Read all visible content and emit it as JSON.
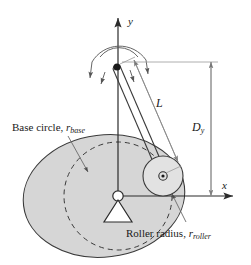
{
  "figure": {
    "background_color": "#ffffff",
    "line_color": "#2b2b2b",
    "cam_fill_color": "#d6d6d6",
    "dimension_line_color": "#8a8a8a",
    "width": 251,
    "height": 265
  },
  "axes": {
    "x_label": "x",
    "y_label": "y",
    "origin_label": ""
  },
  "labels": {
    "base_circle": {
      "text_main": "Base circle, ",
      "symbol": "r",
      "subscript": "base"
    },
    "roller_radius": {
      "text_main": "Roller radius, ",
      "symbol": "r",
      "subscript": "roller"
    },
    "link_length": {
      "symbol": "L",
      "subscript": ""
    },
    "offset_distance": {
      "symbol": "D",
      "subscript": "y"
    }
  },
  "components": {
    "cam": "cam-profile-oval",
    "base_circle": "dashed-base-circle",
    "cam_pivot": "ground-pivot-triangle",
    "follower_arm": "follower-link-bar",
    "follower_pivot": "follower-pivot-point",
    "roller": "roller-circle",
    "rotation_arrows": "oscillation-arc-arrows"
  }
}
